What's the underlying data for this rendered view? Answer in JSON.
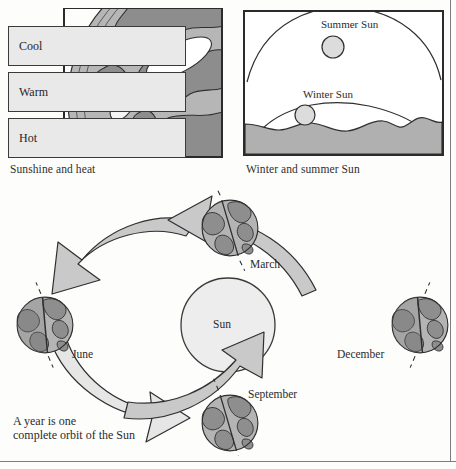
{
  "figure": {
    "panels": {
      "sunshine": {
        "caption": "Sunshine and heat",
        "bands": [
          {
            "label": "Cool"
          },
          {
            "label": "Warm"
          },
          {
            "label": "Hot"
          }
        ],
        "beams": [
          {
            "name": "cool-beam",
            "note": "large elongated footprint"
          },
          {
            "name": "warm-beam",
            "note": "medium footprint"
          },
          {
            "name": "hot-beam",
            "note": "small concentrated footprint"
          }
        ]
      },
      "sun_paths": {
        "caption": "Winter and summer Sun",
        "summer_label": "Summer Sun",
        "winter_label": "Winter Sun"
      }
    },
    "orbit": {
      "sun_label": "Sun",
      "caption_line1": "A year is one",
      "caption_line2": "complete orbit of the Sun",
      "positions": [
        {
          "label": "March",
          "name": "earth-march"
        },
        {
          "label": "June",
          "name": "earth-june"
        },
        {
          "label": "September",
          "name": "earth-september"
        },
        {
          "label": "December",
          "name": "earth-december"
        }
      ],
      "arrows": [
        {
          "name": "arrow-march-to-june",
          "from": "March",
          "to": "June"
        },
        {
          "name": "arrow-june-to-september",
          "from": "June",
          "to": "September"
        },
        {
          "name": "arrow-september-to-december",
          "from": "September",
          "to": "December"
        },
        {
          "name": "arrow-december-to-march",
          "from": "December",
          "to": "March"
        }
      ]
    },
    "colors": {
      "ocean": "#b4b4b4",
      "land": "#8e8e8e",
      "sun_fill": "#ededed",
      "arrow_fill": "#c9c9c9",
      "band_fill": "#e9e9e9",
      "ground_fill": "#b0b0b0",
      "ink": "#2b2b2b"
    }
  }
}
